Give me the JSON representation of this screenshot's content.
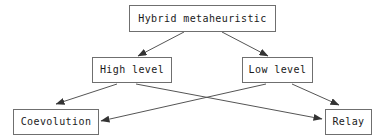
{
  "diagram": {
    "type": "flowchart",
    "nodes": [
      {
        "id": "root",
        "label": "Hybrid metaheuristic",
        "x": 129,
        "y": 5,
        "width": 147,
        "height": 27
      },
      {
        "id": "high",
        "label": "High level",
        "x": 92,
        "y": 57,
        "width": 80,
        "height": 26
      },
      {
        "id": "low",
        "label": "Low level",
        "x": 242,
        "y": 57,
        "width": 71,
        "height": 26
      },
      {
        "id": "coevolution",
        "label": "Coevolution",
        "x": 13,
        "y": 109,
        "width": 86,
        "height": 26
      },
      {
        "id": "relay",
        "label": "Relay",
        "x": 325,
        "y": 109,
        "width": 47,
        "height": 26
      }
    ],
    "edges": [
      {
        "id": "root-to-high",
        "from": "root",
        "to": "high",
        "x1": 184,
        "y1": 32,
        "x2": 138,
        "y2": 56
      },
      {
        "id": "root-to-low",
        "from": "root",
        "to": "low",
        "x1": 222,
        "y1": 32,
        "x2": 268,
        "y2": 56
      },
      {
        "id": "high-to-coevolution",
        "from": "high",
        "to": "coevolution",
        "x1": 117,
        "y1": 84,
        "x2": 56,
        "y2": 104
      },
      {
        "id": "high-to-relay",
        "from": "high",
        "to": "relay",
        "x1": 136,
        "y1": 84,
        "x2": 322,
        "y2": 119
      },
      {
        "id": "low-to-coevolution",
        "from": "low",
        "to": "coevolution",
        "x1": 266,
        "y1": 84,
        "x2": 101,
        "y2": 121
      },
      {
        "id": "low-to-relay",
        "from": "low",
        "to": "relay",
        "x1": 292,
        "y1": 84,
        "x2": 339,
        "y2": 105
      }
    ],
    "style": {
      "line_color": "#555555",
      "box_border_color": "#6f6f6f",
      "text_color": "#1a1a1a",
      "background_color": "#ffffff"
    }
  }
}
